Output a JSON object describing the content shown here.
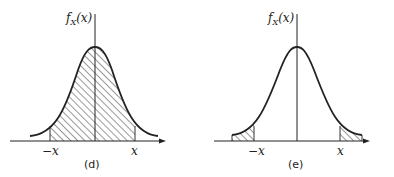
{
  "panels": [
    {
      "id": "d",
      "caption": "(d)",
      "ylabel": "f_X(x)",
      "ylabel_main": "f",
      "ylabel_sub": "X",
      "ylabel_arg": "(x)",
      "tick_left": "−x",
      "tick_right": "x",
      "shading": "between -x and x (central region)"
    },
    {
      "id": "e",
      "caption": "(e)",
      "ylabel": "f_X(x)",
      "ylabel_main": "f",
      "ylabel_sub": "X",
      "ylabel_arg": "(x)",
      "tick_left": "−x",
      "tick_right": "x",
      "shading": "tails beyond -x and x"
    }
  ],
  "colors": {
    "stroke": "#222222",
    "background": "#ffffff"
  }
}
